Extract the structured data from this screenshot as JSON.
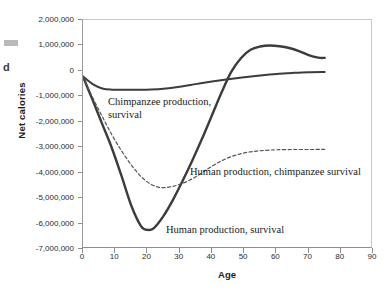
{
  "figure": {
    "artifact_glyph": "d"
  },
  "axes": {
    "ylabel": "Net calories",
    "xlabel": "Age",
    "y_ticks": [
      "2,000,000",
      "1,000,000",
      "0",
      "-1,000,000",
      "-2,000,000",
      "-3,000,000",
      "-4,000,000",
      "-5,000,000",
      "-6,000,000",
      "-7,000,000"
    ],
    "y_tick_values": [
      2000000,
      1000000,
      0,
      -1000000,
      -2000000,
      -3000000,
      -4000000,
      -5000000,
      -6000000,
      -7000000
    ],
    "x_ticks": [
      "0",
      "10",
      "20",
      "30",
      "40",
      "50",
      "60",
      "70",
      "80",
      "90"
    ],
    "x_tick_values": [
      0,
      10,
      20,
      30,
      40,
      50,
      60,
      70,
      80,
      90
    ]
  },
  "annotations": {
    "chimpanzee_production_survival": "Chimpanzee production,\nsurvival",
    "human_production_chimpanzee_survival": "Human production, chimpanzee survival",
    "human_production_survival": "Human production, survival"
  },
  "colors": {
    "line": "#3c3c3c",
    "line_light": "#555555",
    "axis": "#8d8d8d",
    "frame_light": "#c8c8c8",
    "text": "#1c1c1c",
    "artifact": "#b9b9b9"
  },
  "chart_data": {
    "type": "line",
    "title": "",
    "xlabel": "Age",
    "ylabel": "Net calories",
    "xlim": [
      0,
      90
    ],
    "ylim": [
      -7000000,
      2000000
    ],
    "grid": false,
    "legend_position": "inline-annotations",
    "series": [
      {
        "name": "Chimpanzee production, survival",
        "style": "solid",
        "width": 2.0,
        "x": [
          0,
          3,
          6,
          9,
          12,
          15,
          18,
          21,
          25,
          30,
          35,
          40,
          45,
          50,
          55,
          60,
          65,
          70,
          75
        ],
        "y": [
          -220000,
          -520000,
          -690000,
          -740000,
          -745000,
          -745000,
          -745000,
          -735000,
          -700000,
          -620000,
          -520000,
          -420000,
          -330000,
          -250000,
          -180000,
          -120000,
          -80000,
          -50000,
          -40000
        ]
      },
      {
        "name": "Human production, survival",
        "style": "solid",
        "width": 2.4,
        "x": [
          0,
          3,
          6,
          9,
          12,
          15,
          18,
          20,
          22,
          25,
          28,
          31,
          34,
          37,
          40,
          43,
          46,
          49,
          52,
          55,
          58,
          61,
          64,
          67,
          70,
          73,
          75
        ],
        "y": [
          -230000,
          -1150000,
          -2100000,
          -3050000,
          -4150000,
          -5300000,
          -6100000,
          -6250000,
          -6180000,
          -5700000,
          -5050000,
          -4300000,
          -3500000,
          -2650000,
          -1750000,
          -850000,
          -40000,
          500000,
          830000,
          960000,
          1000000,
          970000,
          900000,
          780000,
          620000,
          520000,
          510000
        ]
      },
      {
        "name": "Human production, chimpanzee survival",
        "style": "dashed",
        "width": 1.2,
        "x": [
          0,
          3,
          6,
          9,
          12,
          15,
          18,
          21,
          24,
          27,
          30,
          33,
          36,
          39,
          42,
          45,
          48,
          51,
          54,
          57,
          60,
          65,
          70,
          75
        ],
        "y": [
          -230000,
          -1050000,
          -1800000,
          -2520000,
          -3150000,
          -3700000,
          -4150000,
          -4450000,
          -4580000,
          -4560000,
          -4460000,
          -4300000,
          -4080000,
          -3830000,
          -3600000,
          -3420000,
          -3290000,
          -3200000,
          -3150000,
          -3120000,
          -3100000,
          -3090000,
          -3090000,
          -3085000
        ]
      }
    ]
  }
}
